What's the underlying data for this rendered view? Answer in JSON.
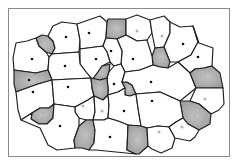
{
  "diagram": {
    "title": "",
    "type": "voronoi-tessellation",
    "frame": {
      "x": 8.5,
      "y": 8.5,
      "w": 221,
      "h": 148
    },
    "colors": {
      "cell_white": "#ffffff",
      "cell_gray": "#a0a0a0",
      "cell_gray_center": "#bdbdbd",
      "edge": "#1e1e1e",
      "dot_dark": "#111111",
      "dot_light": "#b4b4b4",
      "frame": "#8a8a8a"
    },
    "cells": [
      {
        "id": "c1",
        "shade": "white",
        "seed": [
          32,
          59
        ],
        "seed_tone": "dark",
        "points": "16,43 27,41 36,38 39,46 46,52 49,57 48,70 36,73 14,70 13,58"
      },
      {
        "id": "c2",
        "shade": "gray",
        "seed": [
          47,
          44
        ],
        "seed_tone": "light",
        "points": "39,46 36,38 42,35 48,36 53,41 55,48 52,54 46,52"
      },
      {
        "id": "c3",
        "shade": "white",
        "seed": [
          66,
          37
        ],
        "seed_tone": "dark",
        "points": "48,36 53,26 62,22 77,24 80,40 79,52 52,54 55,48 53,41"
      },
      {
        "id": "c4",
        "shade": "white",
        "seed": [
          89,
          33
        ],
        "seed_tone": "dark",
        "points": "77,24 100,16 107,22 106,38 103,46 80,49 80,40"
      },
      {
        "id": "c5",
        "shade": "gray",
        "seed": [
          114,
          31
        ],
        "seed_tone": "light",
        "points": "107,22 108,19 126,19 126,35 117,39 106,38"
      },
      {
        "id": "c6",
        "shade": "white",
        "seed": [
          137,
          31
        ],
        "seed_tone": "light",
        "points": "126,19 137,15 150,20 152,33 147,40 137,41 126,35"
      },
      {
        "id": "c7",
        "shade": "white",
        "seed": [
          162,
          36
        ],
        "seed_tone": "light",
        "points": "150,20 164,16 170,22 170,33 164,47 155,48 152,33"
      },
      {
        "id": "c8",
        "shade": "white",
        "seed": [
          183,
          44
        ],
        "seed_tone": "dark",
        "points": "170,22 180,27 193,26 198,42 191,55 178,62 170,62 164,47 170,33"
      },
      {
        "id": "c9",
        "shade": "white",
        "seed": [
          198,
          57
        ],
        "seed_tone": "dark",
        "points": "193,26 198,42 191,55 178,62 190,73 195,69 204,68 212,66 213,48 199,43"
      },
      {
        "id": "c10",
        "shade": "gray",
        "seed": [
          161,
          59
        ],
        "seed_tone": "light",
        "points": "155,48 164,47 170,62 168,68 160,67 153,65 152,56"
      },
      {
        "id": "c11",
        "shade": "white",
        "seed": [
          133,
          59
        ],
        "seed_tone": "dark",
        "points": "117,39 126,35 137,41 147,40 152,56 153,65 140,70 125,72 121,64 122,51"
      },
      {
        "id": "c12",
        "shade": "white",
        "seed": [
          111,
          51
        ],
        "seed_tone": "dark",
        "points": "103,46 106,38 117,39 122,51 121,64 114,66 110,62 107,52"
      },
      {
        "id": "c13",
        "shade": "white",
        "seed": [
          96,
          59
        ],
        "seed_tone": "dark",
        "points": "80,49 103,46 107,52 110,62 102,66 98,72 92,80 91,78 86,72 80,64"
      },
      {
        "id": "c14",
        "shade": "white",
        "seed": [
          65,
          66
        ],
        "seed_tone": "dark",
        "points": "52,54 79,52 80,64 86,72 91,78 52,80 48,70 49,57"
      },
      {
        "id": "c15",
        "shade": "gray",
        "seed": [
          29,
          80
        ],
        "seed_tone": "dark",
        "points": "14,70 36,73 48,70 52,80 38,84 16,92 14,84"
      },
      {
        "id": "c16",
        "shade": "white",
        "seed": [
          33,
          92
        ],
        "seed_tone": "dark",
        "points": "16,92 38,84 52,80 54,104 49,108 40,108 32,113 21,120 18,110"
      },
      {
        "id": "c17",
        "shade": "white",
        "seed": [
          68,
          87
        ],
        "seed_tone": "dark",
        "points": "52,80 91,78 92,88 94,96 88,100 75,107 54,104"
      },
      {
        "id": "c18",
        "shade": "gray",
        "seed": [
          101,
          72
        ],
        "seed_tone": "light",
        "points": "92,80 98,72 102,66 110,64 109,72 107,78 100,80"
      },
      {
        "id": "c19",
        "shade": "white",
        "seed": [
          114,
          84
        ],
        "seed_tone": "dark",
        "points": "107,78 109,72 114,66 121,64 125,72 122,82 125,88 118,92 108,95 108,88"
      },
      {
        "id": "c20",
        "shade": "gray",
        "seed": [
          127,
          90
        ],
        "seed_tone": "light",
        "points": "122,82 125,88 125,95 130,96 136,94 132,85 127,82"
      },
      {
        "id": "c21",
        "shade": "white",
        "seed": [
          151,
          82
        ],
        "seed_tone": "dark",
        "points": "125,72 140,70 153,65 160,67 168,68 178,62 190,73 196,88 180,101 160,92 136,94 132,85 127,82 122,82"
      },
      {
        "id": "c22",
        "shade": "gray",
        "seed": [
          205,
          78
        ],
        "seed_tone": "light",
        "points": "190,73 195,69 204,68 212,66 220,73 223,88 196,88"
      },
      {
        "id": "c23",
        "shade": "white",
        "seed": [
          205,
          99
        ],
        "seed_tone": "light",
        "points": "196,88 223,88 224,104 219,110 211,114 199,104 190,101"
      },
      {
        "id": "c24",
        "shade": "gray",
        "seed": [
          195,
          115
        ],
        "seed_tone": "light",
        "points": "180,101 190,101 199,104 211,114 210,124 199,130 188,124 183,118"
      },
      {
        "id": "c25",
        "shade": "gray",
        "seed": [
          101,
          94
        ],
        "seed_tone": "light",
        "points": "94,96 92,88 91,78 100,80 107,78 108,88 108,95 103,100"
      },
      {
        "id": "c26",
        "shade": "white",
        "seed": [
          83,
          106
        ],
        "seed_tone": "light",
        "points": "75,107 88,100 94,96 95,112 93,120 86,120 79,118 75,112"
      },
      {
        "id": "c27",
        "shade": "white",
        "seed": [
          102,
          111
        ],
        "seed_tone": "light",
        "points": "95,112 94,96 103,100 108,95 109,105 108,118 104,120 93,120"
      },
      {
        "id": "c28",
        "shade": "white",
        "seed": [
          124,
          111
        ],
        "seed_tone": "dark",
        "points": "108,95 118,92 125,88 125,95 130,96 136,94 138,108 141,126 128,125 118,121 108,118 109,105"
      },
      {
        "id": "c29",
        "shade": "white",
        "seed": [
          152,
          101
        ],
        "seed_tone": "dark",
        "points": "136,94 160,92 180,101 183,118 176,122 169,127 158,126 147,128 141,126 138,108"
      },
      {
        "id": "c30",
        "shade": "gray",
        "seed": [
          43,
          113
        ],
        "seed_tone": "light",
        "points": "32,113 40,108 49,108 54,104 53,118 47,124 39,124 31,119"
      },
      {
        "id": "c31",
        "shade": "white",
        "seed": [
          60,
          126
        ],
        "seed_tone": "dark",
        "points": "21,120 32,113 31,119 39,124 47,124 53,118 54,104 75,107 75,112 79,118 79,126 74,140 75,148 57,150 48,145 40,128"
      },
      {
        "id": "c32",
        "shade": "gray",
        "seed": [
          83,
          136
        ],
        "seed_tone": "light",
        "points": "79,126 86,120 93,120 95,130 94,143 89,150 82,148 75,148 74,140"
      },
      {
        "id": "c33",
        "shade": "white",
        "seed": [
          110,
          137
        ],
        "seed_tone": "dark",
        "points": "93,120 104,120 108,118 118,121 128,125 127,150 136,154 96,150 89,150 94,143 95,130"
      },
      {
        "id": "c34",
        "shade": "gray",
        "seed": [
          136,
          137
        ],
        "seed_tone": "light",
        "points": "128,125 141,126 147,128 148,146 139,154 136,154 127,150"
      },
      {
        "id": "c35",
        "shade": "white",
        "seed": [
          159,
          132
        ],
        "seed_tone": "light",
        "points": "147,128 158,126 169,127 175,138 172,148 161,153 152,149 148,146"
      },
      {
        "id": "c36",
        "shade": "white",
        "seed": [
          182,
          127
        ],
        "seed_tone": "light",
        "points": "169,127 176,122 183,118 188,124 199,130 195,137 190,141 175,138"
      },
      {
        "id": "c37",
        "shade": "white",
        "seed": [
          40,
          42
        ],
        "seed_tone": "none",
        "points": "0,0 0,0"
      }
    ]
  }
}
